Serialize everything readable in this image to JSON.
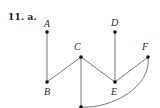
{
  "problem": {
    "number_label": "11. a."
  },
  "graph": {
    "vertices": [
      {
        "id": "A",
        "label": "A",
        "x": 47,
        "y": 32,
        "lx": 44,
        "ly": 27
      },
      {
        "id": "B",
        "label": "B",
        "x": 47,
        "y": 82,
        "lx": 44,
        "ly": 95
      },
      {
        "id": "C",
        "label": "C",
        "x": 81,
        "y": 57,
        "lx": 74,
        "ly": 50
      },
      {
        "id": "D",
        "label": "D",
        "x": 115,
        "y": 32,
        "lx": 111,
        "ly": 26
      },
      {
        "id": "E",
        "label": "E",
        "x": 115,
        "y": 82,
        "lx": 111,
        "ly": 95
      },
      {
        "id": "F",
        "label": "F",
        "x": 148,
        "y": 57,
        "lx": 142,
        "ly": 50
      },
      {
        "id": "G",
        "label": "",
        "x": 81,
        "y": 107,
        "lx": 0,
        "ly": 0
      }
    ],
    "edges": [
      {
        "from": "A",
        "to": "B",
        "type": "line"
      },
      {
        "from": "B",
        "to": "C",
        "type": "line"
      },
      {
        "from": "C",
        "to": "E",
        "type": "line"
      },
      {
        "from": "D",
        "to": "E",
        "type": "line"
      },
      {
        "from": "E",
        "to": "F",
        "type": "line"
      },
      {
        "from": "C",
        "to": "G",
        "type": "line"
      },
      {
        "from": "G",
        "to": "F",
        "type": "curve"
      }
    ]
  }
}
